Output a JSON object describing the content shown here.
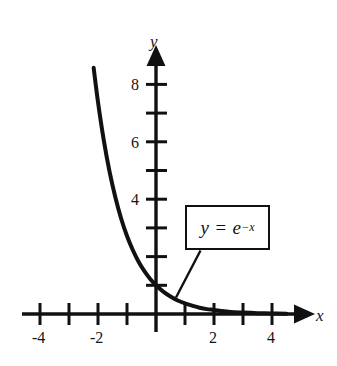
{
  "figure": {
    "background_color": "#ffffff",
    "ink_color": "#111111",
    "axis_labels": {
      "x": "x",
      "y": "y"
    },
    "annotation": {
      "equation_lead": "y = e",
      "equation_exponent": "−x",
      "equation_full": "y = e^{-x}",
      "box_border_color": "#111111"
    }
  },
  "chart_data": {
    "type": "line",
    "title": "",
    "xlabel": "x",
    "ylabel": "y",
    "xlim": [
      -4.6,
      4.9
    ],
    "ylim": [
      -0.9,
      9.2
    ],
    "grid": false,
    "legend": null,
    "annotations": [
      {
        "text": "y = e^{-x}",
        "type": "boxed-callout",
        "points_to_x": 0.75,
        "points_to_y": 0.47
      }
    ],
    "xticks": [
      -4,
      -3,
      -2,
      -1,
      0,
      1,
      2,
      3,
      4
    ],
    "xtick_labels": [
      "-4",
      "",
      "-2",
      "",
      "",
      "",
      "2",
      "",
      "4"
    ],
    "yticks": [
      1,
      2,
      3,
      4,
      5,
      6,
      7,
      8
    ],
    "ytick_labels": [
      "",
      "",
      "",
      "4",
      "",
      "6",
      "",
      "8"
    ],
    "series": [
      {
        "name": "y = e^{-x}",
        "expression": "exp(-x)",
        "color": "#111111",
        "linewidth": 4,
        "x": [
          -2.15,
          -2.0,
          -1.8,
          -1.6,
          -1.4,
          -1.2,
          -1.0,
          -0.8,
          -0.6,
          -0.4,
          -0.2,
          0.0,
          0.25,
          0.5,
          0.75,
          1.0,
          1.25,
          1.5,
          1.75,
          2.0,
          2.5,
          3.0,
          3.5,
          4.0,
          4.5
        ],
        "y": [
          8.58,
          7.39,
          6.05,
          4.95,
          4.06,
          3.32,
          2.72,
          2.23,
          1.82,
          1.49,
          1.22,
          1.0,
          0.78,
          0.61,
          0.47,
          0.37,
          0.29,
          0.22,
          0.17,
          0.14,
          0.08,
          0.05,
          0.03,
          0.02,
          0.01
        ]
      }
    ]
  },
  "tick_labels": {
    "x_neg4": "-4",
    "x_neg2": "-2",
    "x_pos2": "2",
    "x_pos4": "4",
    "y_4": "4",
    "y_6": "6",
    "y_8": "8"
  }
}
